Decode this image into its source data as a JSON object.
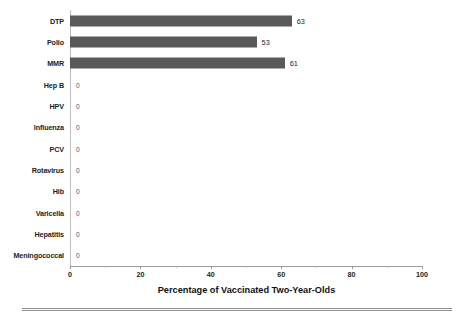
{
  "chart_data": {
    "type": "bar",
    "orientation": "horizontal",
    "title": "",
    "xlabel": "Percentage of Vaccinated Two-Year-Olds",
    "ylabel": "",
    "xlim": [
      0,
      100
    ],
    "xticks": [
      0,
      20,
      40,
      60,
      80,
      100
    ],
    "xtick_labels": [
      "0",
      "20",
      "40",
      "60",
      "80",
      "100"
    ],
    "minor_tick_step": 10,
    "grid": false,
    "legend": false,
    "bar_color": "#595959",
    "axis_color": "#9a9a9a",
    "categories": [
      "DTP",
      "Polio",
      "MMR",
      "Hep B",
      "HPV",
      "Influenza",
      "PCV",
      "Rotavirus",
      "Hib",
      "Varicella",
      "Hepatitis",
      "Meningococcal"
    ],
    "values": [
      63,
      53,
      61,
      0,
      0,
      0,
      0,
      0,
      0,
      0,
      0,
      0
    ],
    "value_labels": [
      "63",
      "53",
      "61",
      "0",
      "0",
      "0",
      "0",
      "0",
      "0",
      "0",
      "0",
      "0"
    ]
  }
}
